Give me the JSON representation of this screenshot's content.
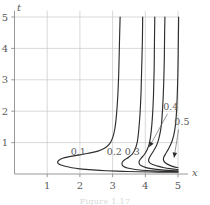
{
  "figure": {
    "caption": "Figure 1.17",
    "background_color": "#ffffff",
    "curve_color": "#2e2e2e",
    "grid_color": "#c9c9c9",
    "axis_color": "#8d8d8d",
    "text_color": "#5a5a5a"
  },
  "chart_data": {
    "type": "line",
    "title": "",
    "xlabel": "x",
    "ylabel": "t",
    "xlim": [
      0,
      5.4
    ],
    "ylim": [
      0,
      5.2
    ],
    "xticks": [
      1,
      2,
      3,
      4,
      5
    ],
    "yticks": [
      1,
      2,
      3,
      4,
      5
    ],
    "xtick_labels": [
      "1",
      "2",
      "3",
      "4",
      "5"
    ],
    "ytick_labels": [
      "1",
      "2",
      "3",
      "4",
      "5"
    ],
    "grid": true,
    "legend": "inline-curve-labels",
    "series": [
      {
        "name": "0.1",
        "label": "0.1",
        "label_position": [
          1.95,
          0.62
        ],
        "asymptote_x": 3.1,
        "nose_point": [
          1.32,
          0.3
        ],
        "points": [
          [
            5.0,
            0.055
          ],
          [
            4.4,
            0.06
          ],
          [
            3.8,
            0.07
          ],
          [
            3.3,
            0.085
          ],
          [
            2.8,
            0.105
          ],
          [
            2.4,
            0.13
          ],
          [
            2.0,
            0.165
          ],
          [
            1.75,
            0.2
          ],
          [
            1.55,
            0.245
          ],
          [
            1.42,
            0.285
          ],
          [
            1.34,
            0.33
          ],
          [
            1.32,
            0.39
          ],
          [
            1.36,
            0.44
          ],
          [
            1.47,
            0.5
          ],
          [
            1.65,
            0.545
          ],
          [
            1.95,
            0.6
          ],
          [
            2.25,
            0.66
          ],
          [
            2.55,
            0.73
          ],
          [
            2.75,
            0.82
          ],
          [
            2.9,
            0.95
          ],
          [
            3.0,
            1.15
          ],
          [
            3.07,
            1.45
          ],
          [
            3.12,
            1.9
          ],
          [
            3.16,
            2.5
          ],
          [
            3.19,
            3.3
          ],
          [
            3.21,
            4.2
          ],
          [
            3.23,
            5.0
          ]
        ]
      },
      {
        "name": "0.2",
        "label": "0.2",
        "label_position": [
          3.05,
          0.6
        ],
        "asymptote_x": 3.72,
        "nose_point": [
          3.28,
          0.33
        ],
        "points": [
          [
            5.0,
            0.075
          ],
          [
            4.6,
            0.085
          ],
          [
            4.2,
            0.1
          ],
          [
            3.9,
            0.12
          ],
          [
            3.65,
            0.15
          ],
          [
            3.45,
            0.19
          ],
          [
            3.34,
            0.24
          ],
          [
            3.29,
            0.3
          ],
          [
            3.3,
            0.38
          ],
          [
            3.38,
            0.46
          ],
          [
            3.5,
            0.54
          ],
          [
            3.62,
            0.66
          ],
          [
            3.7,
            0.82
          ],
          [
            3.76,
            1.05
          ],
          [
            3.8,
            1.4
          ],
          [
            3.84,
            1.95
          ],
          [
            3.87,
            2.6
          ],
          [
            3.89,
            3.4
          ],
          [
            3.91,
            4.2
          ],
          [
            3.92,
            5.0
          ]
        ]
      },
      {
        "name": "0.3",
        "label": "0.3",
        "label_position": [
          3.6,
          0.6
        ],
        "asymptote_x": 4.08,
        "nose_point": [
          3.8,
          0.35
        ],
        "points": [
          [
            5.0,
            0.1
          ],
          [
            4.7,
            0.115
          ],
          [
            4.42,
            0.14
          ],
          [
            4.18,
            0.17
          ],
          [
            4.0,
            0.21
          ],
          [
            3.88,
            0.26
          ],
          [
            3.82,
            0.32
          ],
          [
            3.81,
            0.4
          ],
          [
            3.87,
            0.5
          ],
          [
            3.97,
            0.62
          ],
          [
            4.06,
            0.78
          ],
          [
            4.13,
            1.0
          ],
          [
            4.18,
            1.35
          ],
          [
            4.22,
            1.85
          ],
          [
            4.25,
            2.5
          ],
          [
            4.27,
            3.3
          ],
          [
            4.28,
            4.2
          ],
          [
            4.29,
            5.0
          ]
        ]
      },
      {
        "name": "0.4",
        "label": "0.4",
        "label_position": [
          4.78,
          2.05
        ],
        "arrow_from": [
          4.68,
          1.92
        ],
        "arrow_to": [
          4.12,
          0.86
        ],
        "asymptote_x": 4.42,
        "nose_point": [
          4.1,
          0.4
        ],
        "points": [
          [
            5.0,
            0.14
          ],
          [
            4.8,
            0.165
          ],
          [
            4.58,
            0.2
          ],
          [
            4.38,
            0.25
          ],
          [
            4.22,
            0.3
          ],
          [
            4.13,
            0.36
          ],
          [
            4.1,
            0.44
          ],
          [
            4.14,
            0.55
          ],
          [
            4.23,
            0.7
          ],
          [
            4.34,
            0.9
          ],
          [
            4.42,
            1.15
          ],
          [
            4.49,
            1.55
          ],
          [
            4.53,
            2.1
          ],
          [
            4.56,
            2.8
          ],
          [
            4.58,
            3.6
          ],
          [
            4.59,
            4.4
          ],
          [
            4.6,
            5.0
          ]
        ]
      },
      {
        "name": "0.5",
        "label": "0.5",
        "label_position": [
          5.12,
          1.55
        ],
        "arrow_from": [
          5.02,
          1.42
        ],
        "arrow_to": [
          4.88,
          0.52
        ],
        "asymptote_x": 4.72,
        "nose_point": [
          4.55,
          0.48
        ],
        "points": [
          [
            5.0,
            0.2
          ],
          [
            4.86,
            0.235
          ],
          [
            4.72,
            0.29
          ],
          [
            4.62,
            0.35
          ],
          [
            4.56,
            0.43
          ],
          [
            4.56,
            0.52
          ],
          [
            4.62,
            0.64
          ],
          [
            4.72,
            0.82
          ],
          [
            4.82,
            1.05
          ],
          [
            4.9,
            1.4
          ],
          [
            4.95,
            1.9
          ],
          [
            4.98,
            2.6
          ],
          [
            5.0,
            3.4
          ],
          [
            5.01,
            4.2
          ],
          [
            5.02,
            5.0
          ]
        ]
      }
    ]
  }
}
